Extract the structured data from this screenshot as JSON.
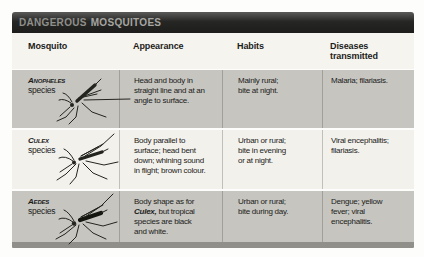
{
  "title": {
    "part1": "DANGEROUS",
    "part2": "MOSQUITOES"
  },
  "colors": {
    "titlebar_bg": "#262624",
    "titlebar_text": "#9b9b97",
    "row_gray": "#c6c5c0",
    "row_light": "#f3f1ec",
    "header_bg": "#f6f4ef",
    "bottom_bar": "#918f8a",
    "text": "#1c1c1a"
  },
  "table": {
    "headers": {
      "mosquito": "Mosquito",
      "appearance": "Appearance",
      "habits": "Habits",
      "diseases": "Diseases\ntransmitted"
    },
    "rows": [
      {
        "species_name": "Anopheles",
        "species_suffix": "species",
        "illustration": "anopheles-mosquito-illustration",
        "appearance": "Head and body in\nstraight line and at an\nangle to surface.",
        "habits": "Mainly rural;\nbite at night.",
        "diseases": "Malaria; filariasis."
      },
      {
        "species_name": "Culex",
        "species_suffix": "species",
        "illustration": "culex-mosquito-illustration",
        "appearance": "Body parallel to\nsurface; head bent\ndown; whining sound\nin flight; brown colour.",
        "habits": "Urban or rural;\nbite in evening\nor at night.",
        "diseases": "Viral encephalitis;\nfilariasis."
      },
      {
        "species_name": "Aedes",
        "species_suffix": "species",
        "illustration": "aedes-mosquito-illustration",
        "appearance_prefix": "Body shape as for\n",
        "appearance_em": "Culex,",
        "appearance_suffix": " but tropical\nspecies are black\nand white.",
        "habits": "Urban or rural;\nbite during day.",
        "diseases": "Dengue; yellow\nfever; viral\nencephalitis."
      }
    ]
  }
}
